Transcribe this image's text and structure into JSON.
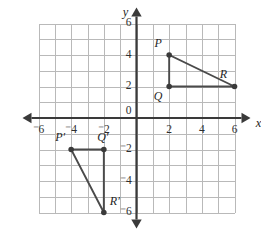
{
  "figure": {
    "kind": "coordinate-plane",
    "background_color": "#ffffff",
    "grid_color": "#b9b9b9",
    "axis_color": "#3a3a3a",
    "shape_color": "#4a4a4a"
  },
  "chart_data": {
    "type": "scatter",
    "title": "",
    "xlabel": "x",
    "ylabel": "y",
    "xlim": [
      -6,
      6
    ],
    "ylim": [
      -6,
      6
    ],
    "grid": true,
    "legend": "none",
    "x_ticks": [
      "⁻6",
      "⁻4",
      "⁻2",
      "0",
      "2",
      "4",
      "6"
    ],
    "x_tick_values": [
      -6,
      -4,
      -2,
      0,
      2,
      4,
      6
    ],
    "y_ticks": [
      "6",
      "4",
      "2",
      "0",
      "⁻2",
      "⁻4",
      "⁻6"
    ],
    "y_tick_values": [
      6,
      4,
      2,
      0,
      -2,
      -4,
      -6
    ],
    "origin_label": "0",
    "grid_step": 1,
    "tick_step": 2,
    "series": [
      {
        "name": "Triangle PQR",
        "closed": true,
        "points": [
          {
            "label": "P",
            "x": 2,
            "y": 4,
            "label_dx": -11,
            "label_dy": -11
          },
          {
            "label": "Q",
            "x": 2,
            "y": 2,
            "label_dx": -11,
            "label_dy": 11
          },
          {
            "label": "R",
            "x": 6,
            "y": 2,
            "label_dx": -11,
            "label_dy": -11
          }
        ]
      },
      {
        "name": "Triangle P'Q'R'",
        "closed": true,
        "points": [
          {
            "label": "P′",
            "x": -4,
            "y": -2,
            "label_dx": -11,
            "label_dy": -11
          },
          {
            "label": "Q′",
            "x": -2,
            "y": -2,
            "label_dx": -1,
            "label_dy": -11
          },
          {
            "label": "R′",
            "x": -2,
            "y": -6,
            "label_dx": 11,
            "label_dy": -10
          }
        ]
      }
    ]
  },
  "labels": {
    "x_axis_name": "x",
    "y_axis_name": "y"
  }
}
